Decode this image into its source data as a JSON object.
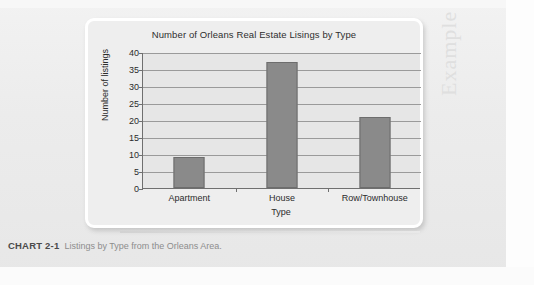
{
  "page": {
    "watermark_text": "Example"
  },
  "figure": {
    "caption_label": "CHART 2-1",
    "caption_text": "Listings by Type from the Orleans Area."
  },
  "chart_data": {
    "type": "bar",
    "title": "Number of Orleans Real Estate Lisings by Type",
    "xlabel": "Type",
    "ylabel": "Number of listings",
    "categories": [
      "Apartment",
      "House",
      "Row/Townhouse"
    ],
    "values": [
      9,
      37,
      21
    ],
    "ylim": [
      0,
      40
    ],
    "yticks": [
      0,
      5,
      10,
      15,
      20,
      25,
      30,
      35,
      40
    ],
    "ytick_labels": [
      "0",
      "5",
      "10",
      "15",
      "20",
      "25",
      "30",
      "35",
      "40"
    ],
    "grid": true,
    "legend": "none",
    "bar_color": "#8a8a8a",
    "plot_background": "#e6e6e6"
  }
}
